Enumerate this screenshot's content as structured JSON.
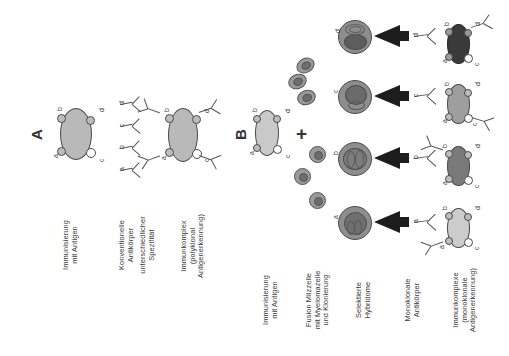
{
  "figure": {
    "language": "de",
    "orientation": "rotated-90-ccw",
    "background_color": "#ffffff",
    "ink_color": "#333333"
  },
  "panels": [
    {
      "letter": "A",
      "name": "polyclonal-pathway",
      "steps": [
        {
          "label": "Immunisierung\nmit Antigen"
        },
        {
          "label": "Konventionelle\nAntikörper\nunterschiedlicher\nSpezifität"
        },
        {
          "label": "Immunkomplex\n(polyklonal\nAntigenerkennung)"
        }
      ],
      "step_labels": {
        "immunization": "Immunisierung\nmit Antigen",
        "antibodies_line1": "Konventionelle\nAntikörper",
        "antibodies_line2": "unterschiedlicher\nSpezifität",
        "complex": "Immunkomplex\n(polyklonal\nAntigenerkennung)"
      },
      "antigen": {
        "name": "antigen-with-epitopes",
        "fill": "#b9b9b9",
        "epitopes": [
          "a",
          "b",
          "c",
          "d"
        ]
      },
      "antibodies": [
        {
          "specificity": "a"
        },
        {
          "specificity": "b"
        },
        {
          "specificity": "c"
        },
        {
          "specificity": "d"
        }
      ],
      "immune_complex": {
        "fill": "#b9b9b9",
        "bound_epitopes": [
          "a",
          "b",
          "c",
          "d"
        ],
        "antibody_count": 4
      }
    },
    {
      "letter": "B",
      "name": "monoclonal-pathway",
      "step_labels": {
        "immunization": "Immunisierung\nmit Antigen",
        "fusion": "Fusion Milzzelle\nmit Myelomazelle\nund Klonierung",
        "hybridoma": "Selektierte\nHybridome",
        "antibody": "Monoklonale\nAntikörper",
        "complex": "Immunkomplexe\n(monoklonale\nAntigenerkennung)"
      },
      "antigen": {
        "name": "antigen-with-epitopes",
        "fill": "#c9c9c9",
        "epitopes": [
          "a",
          "b",
          "c",
          "d"
        ]
      },
      "operator": "+",
      "cells": {
        "name": "spleen-and-myeloma-cells",
        "count": 6,
        "fill": "#9a9a9a"
      },
      "rows": [
        {
          "clone": "d",
          "hybridoma_fill": "#8d8d8d",
          "antibody_specificity": "d",
          "complex_fill": "#3a3a3a",
          "bound_epitope": "d"
        },
        {
          "clone": "c",
          "hybridoma_fill": "#8d8d8d",
          "antibody_specificity": "c",
          "complex_fill": "#9e9e9e",
          "bound_epitope": "c"
        },
        {
          "clone": "b",
          "hybridoma_fill": "#8d8d8d",
          "antibody_specificity": "b",
          "complex_fill": "#7a7a7a",
          "bound_epitope": "b"
        },
        {
          "clone": "a",
          "hybridoma_fill": "#8d8d8d",
          "antibody_specificity": "a",
          "complex_fill": "#cccccc",
          "bound_epitope": "a"
        }
      ]
    }
  ],
  "epitope_letters": {
    "a": "a",
    "b": "b",
    "c": "c",
    "d": "d"
  }
}
